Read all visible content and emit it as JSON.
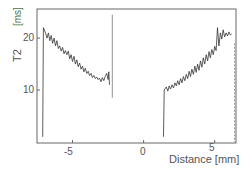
{
  "chart_data": {
    "type": "line",
    "title": "",
    "xlabel": "Distance [mm]",
    "ylabel": "T2",
    "ylabel_unit": "[ms]",
    "xlim": [
      -7.5,
      6.5
    ],
    "ylim": [
      -0.2,
      25.6
    ],
    "xticks": [
      -5,
      0,
      5
    ],
    "yticks": [
      10,
      20
    ],
    "grid": false,
    "legend": "none",
    "series": [
      {
        "name": "left-segment",
        "x": [
          -7.1,
          -7.05,
          -6.9,
          -6.8,
          -6.7,
          -6.6,
          -6.5,
          -6.4,
          -6.3,
          -6.2,
          -6.1,
          -6.0,
          -5.9,
          -5.8,
          -5.7,
          -5.6,
          -5.5,
          -5.4,
          -5.3,
          -5.2,
          -5.1,
          -5.0,
          -4.9,
          -4.8,
          -4.7,
          -4.6,
          -4.5,
          -4.4,
          -4.3,
          -4.2,
          -4.1,
          -4.0,
          -3.9,
          -3.8,
          -3.7,
          -3.6,
          -3.5,
          -3.4,
          -3.3,
          -3.2,
          -3.1,
          -3.0,
          -2.9,
          -2.8,
          -2.7,
          -2.6,
          -2.5,
          -2.45,
          -2.4
        ],
        "y": [
          1,
          22,
          21,
          20,
          21,
          19.5,
          20.5,
          19,
          20,
          18.5,
          19.5,
          18,
          18.5,
          17.5,
          18.2,
          17,
          17.6,
          16.8,
          17.5,
          16,
          16.8,
          15.5,
          16.5,
          15,
          15.8,
          14.5,
          15.2,
          14,
          14.6,
          13.5,
          14.2,
          13.2,
          13.6,
          12.8,
          13.2,
          12.4,
          12.8,
          12.2,
          12.5,
          12,
          12.3,
          11.6,
          12.4,
          11.8,
          12.6,
          13.2,
          12,
          13.5,
          11
        ]
      },
      {
        "name": "left-edge-line",
        "x": [
          -2.2,
          -2.2
        ],
        "y": [
          24.5,
          8.5
        ]
      },
      {
        "name": "right-segment",
        "x": [
          1.4,
          1.45,
          1.6,
          1.7,
          1.8,
          1.9,
          2.0,
          2.1,
          2.2,
          2.3,
          2.4,
          2.5,
          2.6,
          2.7,
          2.8,
          2.9,
          3.0,
          3.1,
          3.2,
          3.3,
          3.4,
          3.5,
          3.6,
          3.7,
          3.8,
          3.9,
          4.0,
          4.1,
          4.2,
          4.3,
          4.4,
          4.5,
          4.6,
          4.7,
          4.8,
          4.9,
          5.0,
          5.1,
          5.2,
          5.3,
          5.4,
          5.5,
          5.6,
          5.7,
          5.8,
          5.9,
          6.0,
          6.1,
          6.2
        ],
        "y": [
          1,
          10,
          10.6,
          9.8,
          10.8,
          10.2,
          11,
          10.4,
          11.4,
          10.8,
          11.8,
          11,
          12.2,
          11.4,
          12.6,
          11.8,
          13,
          12.2,
          13.6,
          12.6,
          14,
          13,
          14.6,
          13.4,
          15,
          13.8,
          15.6,
          14.4,
          16.2,
          15,
          16.8,
          15.6,
          17.4,
          16.2,
          17.8,
          16.8,
          18.4,
          17.6,
          22,
          18.5,
          21,
          19.8,
          21.6,
          20.2,
          21,
          20.4,
          21.2,
          20.6,
          20.8
        ]
      },
      {
        "name": "right-edge-line",
        "x": [
          6.4,
          6.4
        ],
        "y": [
          19,
          0
        ]
      }
    ]
  },
  "axes": {
    "x_tick_labels": [
      "-5",
      "0",
      "5"
    ],
    "y_tick_labels": [
      "10",
      "20"
    ],
    "xlabel": "Distance [mm]",
    "ylabel": "T2",
    "ylabel_unit": "[ms]"
  },
  "colors": {
    "line": "#333333",
    "frame": "#555555",
    "text": "#555555",
    "unit_accent": "#4a7a4a"
  }
}
